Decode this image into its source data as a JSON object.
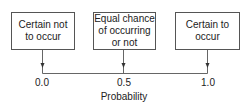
{
  "diagram": {
    "boxes": [
      {
        "label": "Certain not\nto occur",
        "value": "0.0"
      },
      {
        "label": "Equal chance\nof occurring\nor not",
        "value": "0.5"
      },
      {
        "label": "Certain to\noccur",
        "value": "1.0"
      }
    ],
    "axis_label": "Probability",
    "colors": {
      "line": "#555555",
      "text": "#222222",
      "background": "#ffffff"
    }
  }
}
